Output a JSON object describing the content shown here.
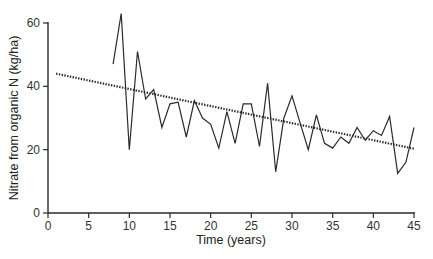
{
  "chart_data": {
    "type": "line",
    "title": "",
    "xlabel": "Time (years)",
    "ylabel": "Nitrate from organic N (kg/ha)",
    "xlim": [
      0,
      45
    ],
    "ylim": [
      0,
      60
    ],
    "xticks": [
      0,
      5,
      10,
      15,
      20,
      25,
      30,
      35,
      40,
      45
    ],
    "yticks": [
      0,
      20,
      40,
      60
    ],
    "grid": false,
    "legend": null,
    "series": [
      {
        "name": "Observed",
        "style": "solid",
        "x": [
          8,
          9,
          10,
          11,
          12,
          13,
          14,
          15,
          16,
          17,
          18,
          19,
          20,
          21,
          22,
          23,
          24,
          25,
          26,
          27,
          28,
          29,
          30,
          31,
          32,
          33,
          34,
          35,
          36,
          37,
          38,
          39,
          40,
          41,
          42,
          43,
          44,
          45
        ],
        "values": [
          47,
          63,
          20,
          51,
          36,
          39,
          27,
          34.5,
          35,
          24,
          35.5,
          30,
          28,
          20.5,
          32,
          22,
          34.5,
          34.5,
          21,
          41,
          13,
          30,
          37,
          28.5,
          20,
          31,
          22,
          20.5,
          24,
          22,
          27,
          23,
          26,
          24.5,
          30.5,
          12.5,
          16,
          27
        ]
      },
      {
        "name": "Trend",
        "style": "dotted",
        "x": [
          1,
          45
        ],
        "values": [
          44,
          20.3
        ]
      }
    ]
  }
}
